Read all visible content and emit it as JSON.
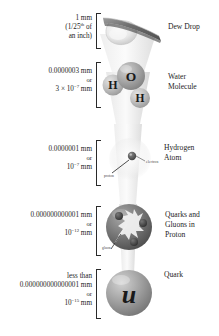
{
  "figure": {
    "palette": {
      "ink": "#1d1d1d",
      "bracket": "#2a2a2a",
      "cone_light": "#f2f2f2",
      "cone_mid": "#d8d8d8",
      "sphere_dark": "#6f6f6f",
      "sphere_mid": "#9a9a9a",
      "sphere_light": "#cfcfcf",
      "highlight": "#ffffff"
    }
  },
  "levels": [
    {
      "id": "dew-drop",
      "label_lines": [
        "Dew Drop"
      ],
      "size_lines": [
        "1 mm",
        "(1/25th of",
        "an inch)"
      ],
      "size_plain": "1 mm (1/25th of an inch)",
      "art": "dew-drop-on-blade"
    },
    {
      "id": "water-molecule",
      "label_lines": [
        "Water",
        "Molecule"
      ],
      "size_lines": [
        "0.0000003 mm",
        "or",
        "3 × 10−7 mm"
      ],
      "size_plain": "0.0000003 mm or 3 × 10^-7 mm",
      "art": "water-molecule",
      "atoms": [
        {
          "symbol": "O",
          "role": "oxygen"
        },
        {
          "symbol": "H",
          "role": "hydrogen-left"
        },
        {
          "symbol": "H",
          "role": "hydrogen-right"
        }
      ]
    },
    {
      "id": "hydrogen-atom",
      "label_lines": [
        "Hydrogen",
        "Atom"
      ],
      "size_lines": [
        "0.0000001 mm",
        "or",
        "10−7 mm"
      ],
      "size_plain": "0.0000001 mm or 10^-7 mm",
      "art": "hydrogen-atom",
      "callouts": [
        {
          "text": "proton",
          "id": "proton-callout"
        },
        {
          "text": "electron",
          "id": "electron-callout"
        }
      ]
    },
    {
      "id": "quarks-gluons",
      "label_lines": [
        "Quarks and",
        "Gluons in",
        "Proton"
      ],
      "size_lines": [
        "0.000000000001 mm",
        "or",
        "10−12 mm"
      ],
      "size_plain": "0.000000000001 mm or 10^-12 mm",
      "art": "proton-with-quarks",
      "callouts": [
        {
          "text": "gluon",
          "id": "gluon-callout"
        }
      ]
    },
    {
      "id": "quark",
      "label_lines": [
        "Quark"
      ],
      "size_lines": [
        "less than",
        "0.000000000000001 mm",
        "or",
        "10−15 mm"
      ],
      "size_plain": "less than 0.000000000000001 mm or 10^-15 mm",
      "art": "up-quark-sphere",
      "glyph": "u"
    }
  ],
  "exponents": {
    "water": "-7",
    "hydrogen": "-7",
    "proton": "-12",
    "quark": "-15"
  },
  "bottom_note": ""
}
